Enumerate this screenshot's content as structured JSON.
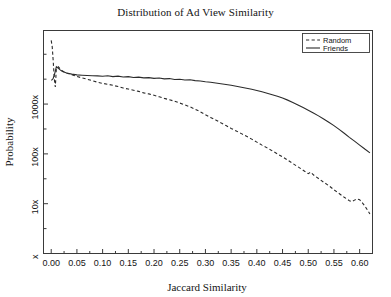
{
  "chart_data": {
    "type": "line",
    "title": "Distribution of Ad View Similarity",
    "xlabel": "Jaccard Similarity",
    "ylabel": "Probability",
    "xlim": [
      -0.015,
      0.625
    ],
    "ylim_log_decades": [
      "x",
      "10x",
      "100x",
      "1000x"
    ],
    "yscale": "log",
    "grid": false,
    "legend_position": "top-right",
    "x_tick_labels": [
      "0.00",
      "0.05",
      "0.10",
      "0.15",
      "0.20",
      "0.25",
      "0.30",
      "0.35",
      "0.40",
      "0.45",
      "0.50",
      "0.55",
      "0.60"
    ],
    "x_tick_values": [
      0.0,
      0.05,
      0.1,
      0.15,
      0.2,
      0.25,
      0.3,
      0.35,
      0.4,
      0.45,
      0.5,
      0.55,
      0.6
    ],
    "y_tick_labels": [
      "x",
      "10x",
      "100x",
      "1000x"
    ],
    "y_tick_values": [
      1,
      10,
      100,
      1000
    ],
    "series": [
      {
        "name": "Random",
        "style": "dashed",
        "color": "#2b2b2b",
        "x": [
          0.0,
          0.002,
          0.004,
          0.006,
          0.008,
          0.01,
          0.014,
          0.018,
          0.022,
          0.026,
          0.03,
          0.04,
          0.05,
          0.06,
          0.07,
          0.08,
          0.09,
          0.1,
          0.11,
          0.12,
          0.13,
          0.14,
          0.15,
          0.16,
          0.17,
          0.18,
          0.19,
          0.2,
          0.21,
          0.22,
          0.23,
          0.24,
          0.25,
          0.26,
          0.27,
          0.28,
          0.29,
          0.3,
          0.31,
          0.32,
          0.33,
          0.34,
          0.35,
          0.36,
          0.37,
          0.38,
          0.39,
          0.4,
          0.41,
          0.42,
          0.43,
          0.44,
          0.45,
          0.46,
          0.47,
          0.48,
          0.49,
          0.5,
          0.505,
          0.51,
          0.52,
          0.53,
          0.54,
          0.55,
          0.56,
          0.57,
          0.575,
          0.58,
          0.585,
          0.59,
          0.595,
          0.6,
          0.605,
          0.61,
          0.615,
          0.62
        ],
        "y": [
          19000,
          14000,
          7000,
          3200,
          2200,
          5200,
          5600,
          5000,
          4600,
          4400,
          4200,
          3900,
          3600,
          3350,
          3150,
          2950,
          2750,
          2600,
          2500,
          2380,
          2250,
          2100,
          2000,
          1900,
          1800,
          1680,
          1600,
          1500,
          1400,
          1300,
          1220,
          1140,
          1050,
          960,
          880,
          790,
          700,
          610,
          540,
          480,
          420,
          370,
          325,
          288,
          255,
          225,
          198,
          172,
          150,
          132,
          115,
          100,
          87,
          75,
          64,
          55,
          47,
          40,
          43,
          38,
          32,
          27,
          23,
          19,
          16,
          13.5,
          12.5,
          11.5,
          11.0,
          11.8,
          12.5,
          12.0,
          10.5,
          9.0,
          7.5,
          6.2
        ]
      },
      {
        "name": "Friends",
        "style": "solid",
        "color": "#2b2b2b",
        "x": [
          0.0,
          0.002,
          0.004,
          0.006,
          0.008,
          0.01,
          0.014,
          0.018,
          0.022,
          0.026,
          0.03,
          0.04,
          0.05,
          0.06,
          0.07,
          0.08,
          0.09,
          0.1,
          0.11,
          0.12,
          0.13,
          0.14,
          0.15,
          0.16,
          0.17,
          0.18,
          0.19,
          0.2,
          0.21,
          0.22,
          0.23,
          0.24,
          0.25,
          0.26,
          0.27,
          0.28,
          0.29,
          0.3,
          0.31,
          0.32,
          0.33,
          0.34,
          0.35,
          0.36,
          0.37,
          0.38,
          0.39,
          0.4,
          0.41,
          0.42,
          0.43,
          0.44,
          0.45,
          0.46,
          0.47,
          0.48,
          0.49,
          0.5,
          0.51,
          0.52,
          0.53,
          0.54,
          0.55,
          0.56,
          0.57,
          0.58,
          0.59,
          0.6,
          0.61,
          0.62
        ],
        "y": [
          3000,
          3100,
          3300,
          3800,
          4600,
          5600,
          5200,
          4800,
          4500,
          4350,
          4200,
          4000,
          3850,
          3800,
          3750,
          3700,
          3680,
          3620,
          3700,
          3560,
          3640,
          3500,
          3560,
          3420,
          3480,
          3360,
          3400,
          3280,
          3330,
          3200,
          3250,
          3120,
          3160,
          3040,
          3080,
          2960,
          2900,
          2800,
          2750,
          2650,
          2560,
          2480,
          2380,
          2280,
          2180,
          2080,
          1980,
          1880,
          1760,
          1650,
          1540,
          1430,
          1320,
          1200,
          1080,
          960,
          850,
          750,
          660,
          580,
          500,
          430,
          370,
          310,
          260,
          215,
          180,
          150,
          125,
          105
        ]
      }
    ]
  }
}
